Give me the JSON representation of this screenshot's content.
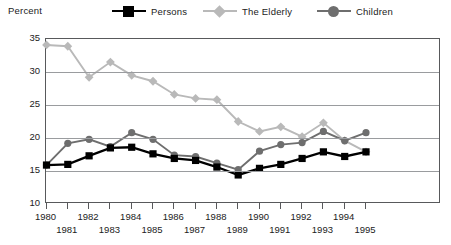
{
  "axis_title": "Percent",
  "legend": [
    {
      "label": "Persons",
      "marker": "square-marker",
      "color": "#000000"
    },
    {
      "label": "The Elderly",
      "marker": "diamond-marker",
      "color": "#b9b9b9"
    },
    {
      "label": "Children",
      "marker": "circle-marker",
      "color": "#6e6e6e"
    }
  ],
  "chart_data": {
    "type": "line",
    "title": "",
    "xlabel": "",
    "ylabel": "Percent",
    "ylim": [
      10,
      35
    ],
    "yticks": [
      35,
      30,
      25,
      20,
      15,
      10
    ],
    "grid": true,
    "legend_position": "top",
    "categories": [
      "1980",
      "1981",
      "1982",
      "1983",
      "1984",
      "1985",
      "1986",
      "1987",
      "1988",
      "1989",
      "1990",
      "1991",
      "1992",
      "1993",
      "1994",
      "1995"
    ],
    "series": [
      {
        "name": "Persons",
        "marker": "square",
        "color": "#000000",
        "values": [
          15.9,
          16.0,
          17.3,
          18.5,
          18.6,
          17.6,
          16.9,
          16.6,
          15.6,
          14.4,
          15.4,
          16.0,
          16.9,
          17.9,
          17.2,
          17.9
        ]
      },
      {
        "name": "The Elderly",
        "marker": "diamond",
        "color": "#b9b9b9",
        "values": [
          34.1,
          33.9,
          29.2,
          31.5,
          29.5,
          28.6,
          26.6,
          26.0,
          25.8,
          22.5,
          21.0,
          21.7,
          20.2,
          22.3,
          19.6,
          17.9
        ]
      },
      {
        "name": "Children",
        "marker": "circle",
        "color": "#6e6e6e",
        "values": [
          15.9,
          19.2,
          19.8,
          18.7,
          20.8,
          19.8,
          17.4,
          17.2,
          16.2,
          15.2,
          18.0,
          19.0,
          19.3,
          21.0,
          19.6,
          20.8
        ]
      }
    ]
  }
}
